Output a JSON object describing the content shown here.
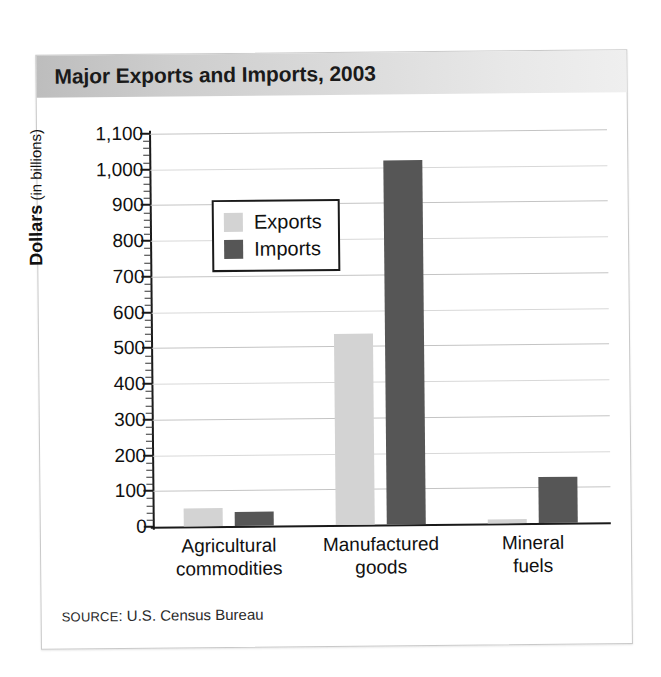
{
  "figure": {
    "title": "Major Exports and Imports, 2003",
    "source_prefix": "Source",
    "source_sep": ": ",
    "source_text": "U.S. Census Bureau"
  },
  "axis": {
    "y_title_main": "Dollars",
    "y_title_sub": " (in billions)"
  },
  "colors": {
    "exports": "#d3d3d3",
    "imports": "#565656",
    "axis": "#1a1a1a",
    "grid": "#c4c4c4",
    "title_band_start": "#bdbdbd",
    "title_band_end": "#efefef"
  },
  "chart_data": {
    "type": "bar",
    "title": "Major Exports and Imports, 2003",
    "xlabel": "",
    "ylabel": "Dollars (in billions)",
    "ylim": [
      0,
      1100
    ],
    "ytick_step": 100,
    "yminor_step": 20,
    "ytick_labels": [
      "0",
      "100",
      "200",
      "300",
      "400",
      "500",
      "600",
      "700",
      "800",
      "900",
      "1,000",
      "1,100"
    ],
    "ytick_values": [
      0,
      100,
      200,
      300,
      400,
      500,
      600,
      700,
      800,
      900,
      1000,
      1100
    ],
    "grid": true,
    "legend_position": "upper-left-inside",
    "categories": [
      "Agricultural commodities",
      "Manufactured goods",
      "Mineral fuels"
    ],
    "category_lines": [
      [
        "Agricultural",
        "commodities"
      ],
      [
        "Manufactured",
        "goods"
      ],
      [
        "Mineral",
        "fuels"
      ]
    ],
    "series": [
      {
        "name": "Exports",
        "color": "#d3d3d3",
        "values": [
          50,
          535,
          10
        ]
      },
      {
        "name": "Imports",
        "color": "#565656",
        "values": [
          40,
          1020,
          130
        ]
      }
    ],
    "units": "billions of dollars",
    "source": "U.S. Census Bureau"
  }
}
